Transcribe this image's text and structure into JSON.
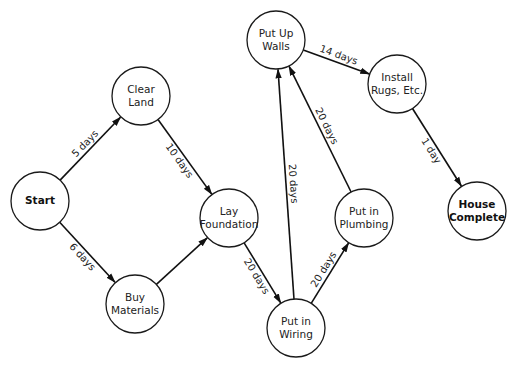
{
  "diagram": {
    "type": "network-activity-graph",
    "nodes": [
      {
        "id": "start",
        "lines": [
          "Start"
        ],
        "bold": true,
        "cx": 40,
        "cy": 201
      },
      {
        "id": "clear_land",
        "lines": [
          "Clear",
          "Land"
        ],
        "bold": false,
        "cx": 141,
        "cy": 96
      },
      {
        "id": "buy_materials",
        "lines": [
          "Buy",
          "Materials"
        ],
        "bold": false,
        "cx": 135,
        "cy": 304
      },
      {
        "id": "lay_foundation",
        "lines": [
          "Lay",
          "Foundation"
        ],
        "bold": false,
        "cx": 229,
        "cy": 218
      },
      {
        "id": "put_up_walls",
        "lines": [
          "Put Up",
          "Walls"
        ],
        "bold": false,
        "cx": 276,
        "cy": 40
      },
      {
        "id": "install_rugs",
        "lines": [
          "Install",
          "Rugs, Etc."
        ],
        "bold": false,
        "cx": 397,
        "cy": 84
      },
      {
        "id": "put_in_plumbing",
        "lines": [
          "Put in",
          "Plumbing"
        ],
        "bold": false,
        "cx": 364,
        "cy": 218
      },
      {
        "id": "put_in_wiring",
        "lines": [
          "Put in",
          "Wiring"
        ],
        "bold": false,
        "cx": 296,
        "cy": 328
      },
      {
        "id": "house_complete",
        "lines": [
          "House",
          "Complete"
        ],
        "bold": true,
        "cx": 477,
        "cy": 211
      }
    ],
    "edges": [
      {
        "from": "start",
        "to": "clear_land",
        "label": "5 days",
        "label_side": "left"
      },
      {
        "from": "start",
        "to": "buy_materials",
        "label": "6 days",
        "label_side": "right"
      },
      {
        "from": "clear_land",
        "to": "lay_foundation",
        "label": "10 days",
        "label_side": "right"
      },
      {
        "from": "buy_materials",
        "to": "lay_foundation",
        "label": "",
        "label_side": "left"
      },
      {
        "from": "lay_foundation",
        "to": "put_in_wiring",
        "label": "20 days",
        "label_side": "right"
      },
      {
        "from": "put_in_wiring",
        "to": "put_up_walls",
        "label": "20 days",
        "label_side": "right"
      },
      {
        "from": "put_in_wiring",
        "to": "put_in_plumbing",
        "label": "20 days",
        "label_side": "left"
      },
      {
        "from": "put_in_plumbing",
        "to": "put_up_walls",
        "label": "20 days",
        "label_side": "right"
      },
      {
        "from": "put_up_walls",
        "to": "install_rugs",
        "label": "14 days",
        "label_side": "left"
      },
      {
        "from": "install_rugs",
        "to": "house_complete",
        "label": "1 day",
        "label_side": "right"
      }
    ],
    "node_radius": 29,
    "colors": {
      "stroke": "#111111",
      "background": "#ffffff",
      "text": "#222222"
    }
  }
}
